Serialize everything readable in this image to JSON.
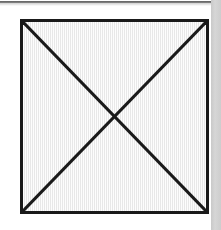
{
  "figure": {
    "shape_name": "square",
    "overlay_name": "crossed-diagonals",
    "canvas": {
      "width": 221,
      "height": 230,
      "background_color": "#ffffff"
    },
    "square": {
      "left": 20,
      "top": 19,
      "width": 189,
      "height": 195,
      "stroke_color": "#1a1a1a",
      "stroke_width": 3,
      "fill_color": "#f1f1f1"
    },
    "diagonals": {
      "stroke_color": "#1a1a1a",
      "stroke_width": 3,
      "lines": [
        {
          "name": "diagonal-top-left-to-bottom-right",
          "x1": 0,
          "y1": 0,
          "x2": 189,
          "y2": 195
        },
        {
          "name": "diagonal-top-right-to-bottom-left",
          "x1": 189,
          "y1": 0,
          "x2": 0,
          "y2": 195
        }
      ],
      "intersection": {
        "x": 94.5,
        "y": 97.5
      }
    },
    "scan_artifacts": {
      "top_band_color": "#4a4a4a",
      "right_strip_color": "#cfcfcf"
    }
  }
}
